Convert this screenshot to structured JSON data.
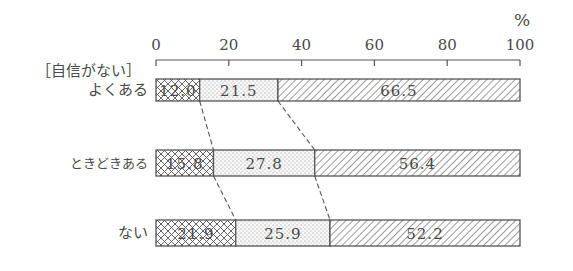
{
  "chart_data": {
    "type": "bar",
    "orientation": "horizontal",
    "stacked": true,
    "percent": true,
    "title": "",
    "unit_label": "%",
    "group_label": "［自信がない］",
    "categories": [
      "よくある",
      "ときどきある",
      "ない"
    ],
    "series": [
      {
        "name": "segment-1",
        "pattern": "crosshatch",
        "values": [
          12.0,
          21.5,
          0
        ]
      },
      {
        "name": "segment-2",
        "pattern": "dots",
        "values": [
          21.5,
          27.8,
          25.9
        ]
      },
      {
        "name": "segment-3",
        "pattern": "diagonal",
        "values": [
          66.5,
          56.4,
          52.2
        ]
      }
    ],
    "rows": [
      {
        "label": "よくある",
        "segments": [
          {
            "value": 12.0,
            "label": "12.0",
            "pattern": "crosshatch"
          },
          {
            "value": 21.5,
            "label": "21.5",
            "pattern": "dots"
          },
          {
            "value": 66.5,
            "label": "66.5",
            "pattern": "diagonal"
          }
        ]
      },
      {
        "label": "ときどきある",
        "segments": [
          {
            "value": 15.8,
            "label": "15.8",
            "pattern": "crosshatch"
          },
          {
            "value": 27.8,
            "label": "27.8",
            "pattern": "dots"
          },
          {
            "value": 56.4,
            "label": "56.4",
            "pattern": "diagonal"
          }
        ]
      },
      {
        "label": "ない",
        "segments": [
          {
            "value": 21.9,
            "label": "21.9",
            "pattern": "crosshatch"
          },
          {
            "value": 25.9,
            "label": "25.9",
            "pattern": "dots"
          },
          {
            "value": 52.2,
            "label": "52.2",
            "pattern": "diagonal"
          }
        ]
      }
    ],
    "x_ticks": [
      0,
      20,
      40,
      60,
      80,
      100
    ],
    "x_tick_labels": [
      "0",
      "20",
      "40",
      "60",
      "80",
      "100"
    ],
    "xlim": [
      0,
      100
    ],
    "xlabel": "",
    "ylabel": "",
    "grid": false,
    "legend": null,
    "connector_lines": "dashed lines connecting segment boundaries between consecutive bars"
  },
  "colors": {
    "ink": "#4a4a4a",
    "background": "#ffffff"
  }
}
